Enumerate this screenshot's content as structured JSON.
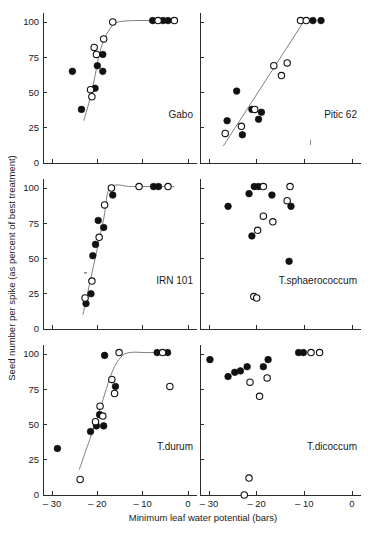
{
  "figure": {
    "xlabel": "Minimum leaf water potential  (bars)",
    "ylabel": "Seed number per spike (as percent of best treatment)",
    "x_ticks": [
      "-30",
      "-20",
      "-10",
      "0"
    ],
    "y_ticks": [
      "100",
      "75",
      "50",
      "25",
      "0"
    ]
  },
  "chart_data": {
    "type": "scatter",
    "title": "",
    "xlabel": "Minimum leaf water potential  (bars)",
    "ylabel": "Seed number per spike (as percent of best treatment)",
    "xlim": [
      -33,
      2
    ],
    "ylim": [
      0,
      105
    ],
    "xticks": [
      -30,
      -20,
      -10,
      0
    ],
    "yticks": [
      0,
      25,
      50,
      75,
      100
    ],
    "grid": false,
    "legend": {
      "position": "none",
      "entries": [
        {
          "name": "filled-circle",
          "marker": "filled circle",
          "color": "#111111"
        },
        {
          "name": "open-circle",
          "marker": "open circle",
          "color": "#ffffff"
        }
      ]
    },
    "panel_layout": {
      "rows": 3,
      "cols": 2,
      "order": [
        "Gabo",
        "Pitic 62",
        "IRN 101",
        "T.sphaerococcum",
        "T.durum",
        "T.dicoccum"
      ]
    },
    "panels": [
      {
        "label": "Gabo",
        "row": 0,
        "col": 0,
        "has_fit_curve": true,
        "fit_curve": [
          {
            "x": -23.0,
            "y": 30
          },
          {
            "x": -21.5,
            "y": 47
          },
          {
            "x": -20.5,
            "y": 62
          },
          {
            "x": -19.5,
            "y": 78
          },
          {
            "x": -18.3,
            "y": 89
          },
          {
            "x": -16.8,
            "y": 97
          },
          {
            "x": -15.5,
            "y": 100
          },
          {
            "x": -12.0,
            "y": 101
          },
          {
            "x": -8.5,
            "y": 101
          },
          {
            "x": -3.0,
            "y": 101
          }
        ],
        "series": [
          {
            "name": "filled-circle",
            "marker": "filled",
            "points": [
              {
                "x": -23.5,
                "y": 38
              },
              {
                "x": -25.5,
                "y": 65
              },
              {
                "x": -20.5,
                "y": 53
              },
              {
                "x": -20.0,
                "y": 69
              },
              {
                "x": -18.8,
                "y": 65
              },
              {
                "x": -18.8,
                "y": 77
              },
              {
                "x": -7.8,
                "y": 101
              },
              {
                "x": -5.5,
                "y": 101
              },
              {
                "x": -4.4,
                "y": 101
              }
            ]
          },
          {
            "name": "open-circle",
            "marker": "open",
            "points": [
              {
                "x": -21.5,
                "y": 52
              },
              {
                "x": -21.2,
                "y": 47
              },
              {
                "x": -20.7,
                "y": 82
              },
              {
                "x": -20.2,
                "y": 77
              },
              {
                "x": -18.6,
                "y": 88
              },
              {
                "x": -16.6,
                "y": 100
              },
              {
                "x": -6.6,
                "y": 101
              },
              {
                "x": -3.0,
                "y": 101
              }
            ]
          }
        ]
      },
      {
        "label": "Pitic 62",
        "row": 0,
        "col": 1,
        "has_fit_curve": true,
        "fit_curve": [
          {
            "x": -27.0,
            "y": 12
          },
          {
            "x": -10.0,
            "y": 101
          }
        ],
        "series": [
          {
            "name": "filled-circle",
            "marker": "filled",
            "points": [
              {
                "x": -26.2,
                "y": 30
              },
              {
                "x": -24.2,
                "y": 51
              },
              {
                "x": -23.0,
                "y": 20
              },
              {
                "x": -21.0,
                "y": 38
              },
              {
                "x": -19.6,
                "y": 31
              },
              {
                "x": -19.0,
                "y": 36
              },
              {
                "x": -8.2,
                "y": 101
              },
              {
                "x": -6.5,
                "y": 101
              }
            ]
          },
          {
            "name": "open-circle",
            "marker": "open",
            "points": [
              {
                "x": -26.6,
                "y": 21
              },
              {
                "x": -23.2,
                "y": 26
              },
              {
                "x": -20.4,
                "y": 38
              },
              {
                "x": -16.4,
                "y": 69
              },
              {
                "x": -14.8,
                "y": 62
              },
              {
                "x": -13.6,
                "y": 71
              },
              {
                "x": -10.8,
                "y": 101
              },
              {
                "x": -9.6,
                "y": 101
              }
            ]
          }
        ]
      },
      {
        "label": "IRN 101",
        "row": 1,
        "col": 0,
        "has_fit_curve": true,
        "fit_curve": [
          {
            "x": -23.2,
            "y": 10
          },
          {
            "x": -18.8,
            "y": 75
          },
          {
            "x": -17.2,
            "y": 100
          },
          {
            "x": -12.5,
            "y": 101
          },
          {
            "x": -8.0,
            "y": 101
          },
          {
            "x": -3.0,
            "y": 101
          }
        ],
        "series": [
          {
            "name": "filled-circle",
            "marker": "filled",
            "points": [
              {
                "x": -22.5,
                "y": 18
              },
              {
                "x": -21.4,
                "y": 25
              },
              {
                "x": -21.0,
                "y": 52
              },
              {
                "x": -20.4,
                "y": 60
              },
              {
                "x": -19.8,
                "y": 77
              },
              {
                "x": -18.6,
                "y": 72
              },
              {
                "x": -16.6,
                "y": 95
              },
              {
                "x": -7.6,
                "y": 101
              },
              {
                "x": -6.5,
                "y": 101
              }
            ]
          },
          {
            "name": "open-circle",
            "marker": "open",
            "points": [
              {
                "x": -22.7,
                "y": 22
              },
              {
                "x": -21.2,
                "y": 34
              },
              {
                "x": -19.6,
                "y": 65
              },
              {
                "x": -18.4,
                "y": 88
              },
              {
                "x": -16.9,
                "y": 100
              },
              {
                "x": -10.8,
                "y": 101
              },
              {
                "x": -4.4,
                "y": 101
              }
            ]
          }
        ]
      },
      {
        "label": "T.sphaerococcum",
        "row": 1,
        "col": 1,
        "has_fit_curve": false,
        "fit_curve": [],
        "series": [
          {
            "name": "filled-circle",
            "marker": "filled",
            "points": [
              {
                "x": -26.0,
                "y": 87
              },
              {
                "x": -21.6,
                "y": 96
              },
              {
                "x": -21.0,
                "y": 66
              },
              {
                "x": -20.5,
                "y": 101
              },
              {
                "x": -19.6,
                "y": 101
              },
              {
                "x": -16.8,
                "y": 95
              },
              {
                "x": -12.8,
                "y": 87
              },
              {
                "x": -13.2,
                "y": 48
              }
            ]
          },
          {
            "name": "open-circle",
            "marker": "open",
            "points": [
              {
                "x": -18.6,
                "y": 101
              },
              {
                "x": -13.0,
                "y": 101
              },
              {
                "x": -13.6,
                "y": 91
              },
              {
                "x": -16.6,
                "y": 76
              },
              {
                "x": -18.6,
                "y": 80
              },
              {
                "x": -19.8,
                "y": 70
              },
              {
                "x": -20.6,
                "y": 23
              },
              {
                "x": -20.0,
                "y": 22
              }
            ]
          }
        ]
      },
      {
        "label": "T.durum",
        "row": 2,
        "col": 0,
        "has_fit_curve": true,
        "fit_curve": [
          {
            "x": -24.0,
            "y": 18
          },
          {
            "x": -20.0,
            "y": 55
          },
          {
            "x": -17.0,
            "y": 85
          },
          {
            "x": -15.0,
            "y": 97
          },
          {
            "x": -13.0,
            "y": 101
          },
          {
            "x": -9.0,
            "y": 101
          },
          {
            "x": -4.0,
            "y": 101
          }
        ],
        "series": [
          {
            "name": "filled-circle",
            "marker": "filled",
            "points": [
              {
                "x": -28.8,
                "y": 33
              },
              {
                "x": -21.5,
                "y": 45
              },
              {
                "x": -20.2,
                "y": 49
              },
              {
                "x": -19.5,
                "y": 57
              },
              {
                "x": -18.6,
                "y": 49
              },
              {
                "x": -18.4,
                "y": 99
              },
              {
                "x": -16.0,
                "y": 77
              },
              {
                "x": -6.8,
                "y": 101
              },
              {
                "x": -4.5,
                "y": 101
              }
            ]
          },
          {
            "name": "open-circle",
            "marker": "open",
            "points": [
              {
                "x": -23.8,
                "y": 11
              },
              {
                "x": -20.4,
                "y": 52
              },
              {
                "x": -19.4,
                "y": 63
              },
              {
                "x": -18.8,
                "y": 56
              },
              {
                "x": -16.8,
                "y": 82
              },
              {
                "x": -16.2,
                "y": 72
              },
              {
                "x": -15.2,
                "y": 101
              },
              {
                "x": -5.6,
                "y": 101
              },
              {
                "x": -4.0,
                "y": 77
              }
            ]
          }
        ]
      },
      {
        "label": "T.dicoccum",
        "row": 2,
        "col": 1,
        "has_fit_curve": false,
        "fit_curve": [],
        "series": [
          {
            "name": "filled-circle",
            "marker": "filled",
            "points": [
              {
                "x": -29.8,
                "y": 96
              },
              {
                "x": -26.0,
                "y": 84
              },
              {
                "x": -24.6,
                "y": 87
              },
              {
                "x": -23.4,
                "y": 88
              },
              {
                "x": -22.0,
                "y": 91
              },
              {
                "x": -18.6,
                "y": 91
              },
              {
                "x": -17.6,
                "y": 96
              },
              {
                "x": -11.2,
                "y": 101
              },
              {
                "x": -10.2,
                "y": 101
              }
            ]
          },
          {
            "name": "open-circle",
            "marker": "open",
            "points": [
              {
                "x": -21.4,
                "y": 80
              },
              {
                "x": -19.4,
                "y": 70
              },
              {
                "x": -17.8,
                "y": 83
              },
              {
                "x": -8.6,
                "y": 101
              },
              {
                "x": -6.8,
                "y": 101
              },
              {
                "x": -21.6,
                "y": 12
              },
              {
                "x": -22.6,
                "y": 0
              }
            ]
          }
        ]
      }
    ]
  }
}
